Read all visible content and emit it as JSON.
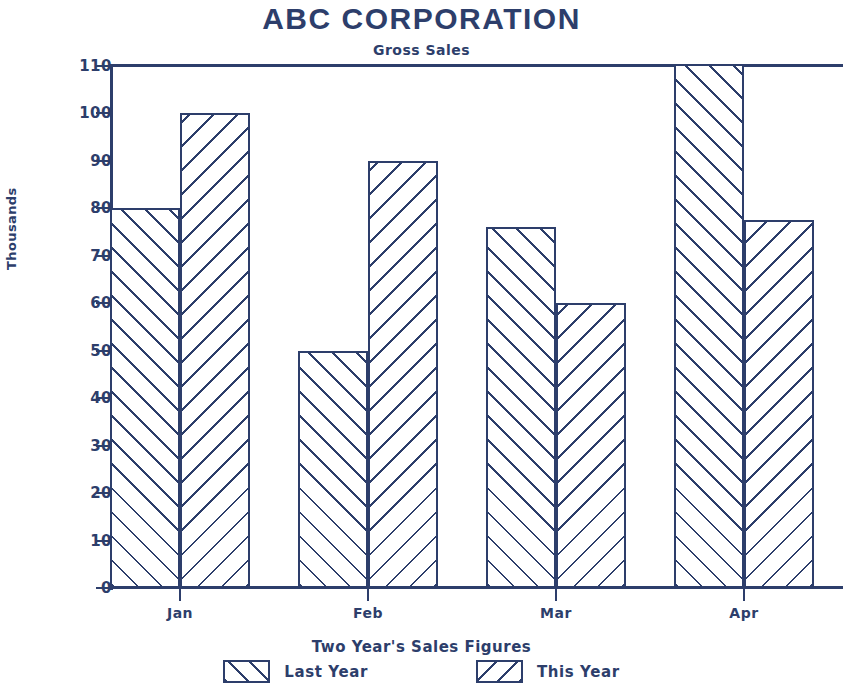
{
  "chart_data": {
    "type": "bar",
    "title": "ABC CORPORATION",
    "subtitle": "Gross Sales",
    "xlabel": "Two Year's Sales Figures",
    "ylabel": "Thousands",
    "categories": [
      "Jan",
      "Feb",
      "Mar",
      "Apr"
    ],
    "series": [
      {
        "name": "Last Year",
        "values": [
          80,
          50,
          76,
          112
        ],
        "hatch": "forward-slash"
      },
      {
        "name": "This Year",
        "values": [
          100,
          90,
          60,
          77.5
        ],
        "hatch": "back-slash"
      }
    ],
    "ylim": [
      0,
      110
    ],
    "ytick_labels": [
      "0",
      "10",
      "20",
      "30",
      "40",
      "50",
      "60",
      "70",
      "80",
      "90",
      "100",
      "110"
    ],
    "ytick_values": [
      0,
      10,
      20,
      30,
      40,
      50,
      60,
      70,
      80,
      90,
      100,
      110
    ],
    "grid": false,
    "legend_position": "bottom",
    "accent_color": "#2d3e6b",
    "background_color": "#ffffff"
  },
  "legend": {
    "entries": [
      {
        "label": "Last Year",
        "style": "last"
      },
      {
        "label": "This Year",
        "style": "this"
      }
    ]
  }
}
